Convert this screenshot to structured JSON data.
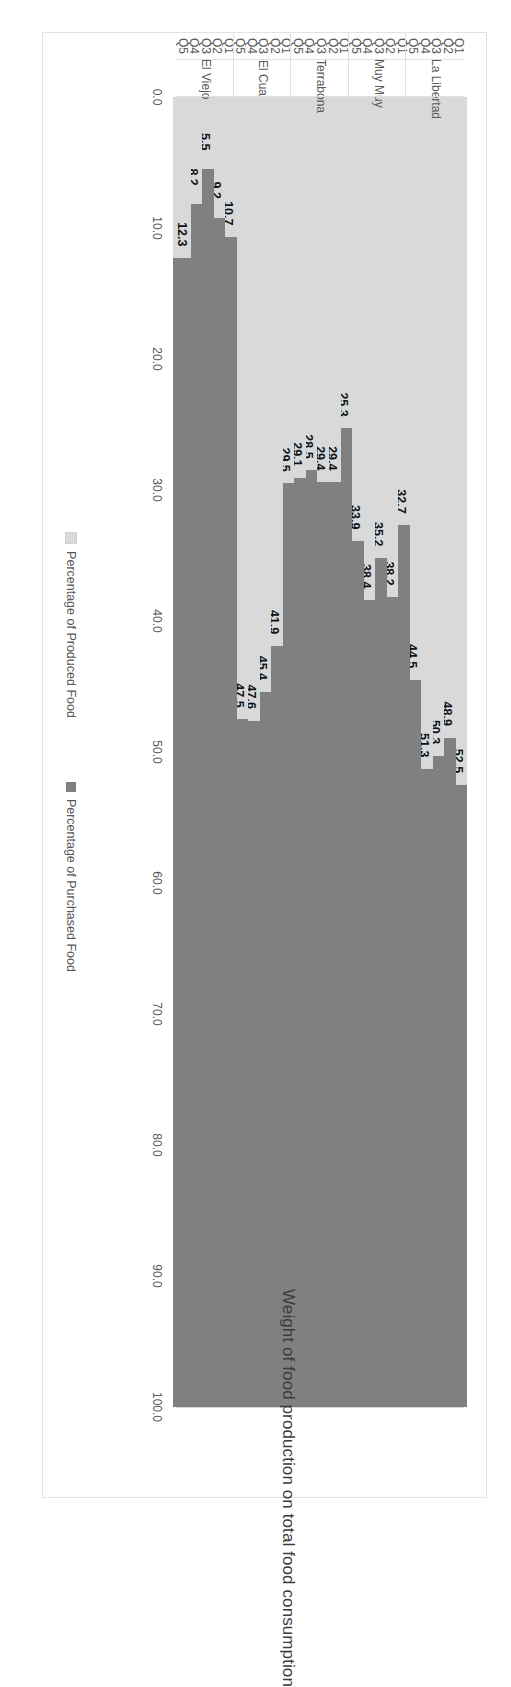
{
  "chart_data": {
    "type": "bar",
    "subtype": "stacked-horizontal",
    "title": "Weight of food production on total food consumption",
    "xlabel": "",
    "ylabel": "",
    "ylim": [
      0,
      100
    ],
    "axis_ticks": [
      "0.0",
      "10.0",
      "20.0",
      "30.0",
      "40.0",
      "50.0",
      "60.0",
      "70.0",
      "80.0",
      "90.0",
      "100.0"
    ],
    "grid": true,
    "legend_position": "bottom",
    "orientation": "rotated-90",
    "series": [
      {
        "name": "Percentage of Produced Food",
        "color": "#d9d9d9",
        "values": [
          52.5,
          48.9,
          50.3,
          51.3,
          44.5,
          32.7,
          38.2,
          35.2,
          38.4,
          33.9,
          25.3,
          29.4,
          29.4,
          28.5,
          29.1,
          29.5,
          41.9,
          45.4,
          47.6,
          47.5,
          10.7,
          9.2,
          5.5,
          8.2,
          12.3
        ]
      },
      {
        "name": "Percentage of Purchased Food",
        "color": "#808080",
        "values": [
          47.5,
          51.1,
          49.7,
          48.7,
          55.5,
          67.3,
          61.8,
          64.8,
          61.6,
          66.1,
          74.7,
          70.6,
          70.6,
          71.5,
          70.9,
          70.5,
          58.1,
          54.6,
          52.4,
          52.5,
          89.3,
          90.8,
          94.5,
          91.8,
          87.7
        ]
      }
    ],
    "categories": [
      "Q1",
      "Q2",
      "Q3",
      "Q4",
      "Q5",
      "Q1",
      "Q2",
      "Q3",
      "Q4",
      "Q5",
      "Q1",
      "Q2",
      "Q3",
      "Q4",
      "Q5",
      "Q1",
      "Q2",
      "Q3",
      "Q4",
      "Q5",
      "Q1",
      "Q2",
      "Q3",
      "Q4",
      "Q5"
    ],
    "groups": [
      {
        "label": "La Libertad",
        "quintiles": [
          "Q1",
          "Q2",
          "Q3",
          "Q4",
          "Q5"
        ],
        "produced": [
          52.5,
          48.9,
          50.3,
          51.3,
          44.5
        ]
      },
      {
        "label": "Muy Muy",
        "quintiles": [
          "Q1",
          "Q2",
          "Q3",
          "Q4",
          "Q5"
        ],
        "produced": [
          32.7,
          38.2,
          35.2,
          38.4,
          33.9
        ]
      },
      {
        "label": "Terrabona",
        "quintiles": [
          "Q1",
          "Q2",
          "Q3",
          "Q4",
          "Q5"
        ],
        "produced": [
          25.3,
          29.4,
          29.4,
          28.5,
          29.1
        ]
      },
      {
        "label": "El Cua",
        "quintiles": [
          "Q1",
          "Q2",
          "Q3",
          "Q4",
          "Q5"
        ],
        "produced": [
          29.5,
          41.9,
          45.4,
          47.6,
          47.5
        ]
      },
      {
        "label": "El Viejo",
        "quintiles": [
          "Q1",
          "Q2",
          "Q3",
          "Q4",
          "Q5"
        ],
        "produced": [
          10.7,
          9.2,
          5.5,
          8.2,
          12.3
        ]
      }
    ],
    "data_labels": [
      "52.5",
      "48.9",
      "50.3",
      "51.3",
      "44.5",
      "32.7",
      "38.2",
      "35.2",
      "38.4",
      "33.9",
      "25.3",
      "29.4",
      "29.4",
      "28.5",
      "29.1",
      "29.5",
      "41.9",
      "45.4",
      "47.6",
      "47.5",
      "10.7",
      "9.2",
      "5.5",
      "8.2",
      "12.3"
    ],
    "legend": [
      {
        "label": "Percentage of Produced Food",
        "color": "#d9d9d9"
      },
      {
        "label": "Percentage of Purchased Food",
        "color": "#808080"
      }
    ]
  }
}
